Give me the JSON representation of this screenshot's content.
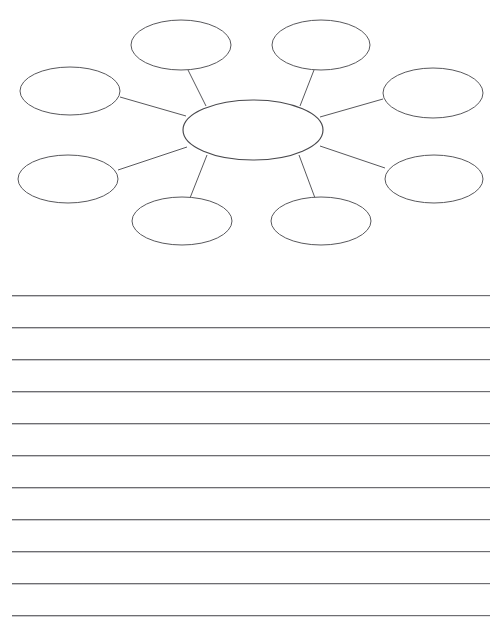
{
  "page": {
    "title": "Blank Web / Cluster Graphic Organizer Worksheet",
    "background_color": "#ffffff",
    "width": 503,
    "height": 634
  },
  "diagram": {
    "type": "cluster-web",
    "stroke_color": "#58585c",
    "fill_color": "#ffffff",
    "center": {
      "label": "",
      "cx": 253,
      "cy": 130,
      "rx": 70,
      "ry": 30
    },
    "nodes": [
      {
        "id": "node-top-left",
        "label": "",
        "cx": 181,
        "cy": 45,
        "rx": 50,
        "ry": 25
      },
      {
        "id": "node-top-right",
        "label": "",
        "cx": 321,
        "cy": 45,
        "rx": 49,
        "ry": 25
      },
      {
        "id": "node-left-upper",
        "label": "",
        "cx": 70,
        "cy": 91,
        "rx": 50,
        "ry": 24
      },
      {
        "id": "node-right-upper",
        "label": "",
        "cx": 433,
        "cy": 93,
        "rx": 50,
        "ry": 25
      },
      {
        "id": "node-left-lower",
        "label": "",
        "cx": 68,
        "cy": 179,
        "rx": 50,
        "ry": 24
      },
      {
        "id": "node-right-lower",
        "label": "",
        "cx": 434,
        "cy": 179,
        "rx": 49,
        "ry": 24
      },
      {
        "id": "node-bottom-left",
        "label": "",
        "cx": 182,
        "cy": 221,
        "rx": 50,
        "ry": 24
      },
      {
        "id": "node-bottom-right",
        "label": "",
        "cx": 321,
        "cy": 221,
        "rx": 50,
        "ry": 24
      }
    ],
    "connectors": [
      {
        "id": "connector-top-left",
        "from": "center",
        "to": "node-top-left",
        "x1": 206,
        "y1": 106,
        "x2": 188,
        "y2": 70
      },
      {
        "id": "connector-top-right",
        "from": "center",
        "to": "node-top-right",
        "x1": 300,
        "y1": 106,
        "x2": 314,
        "y2": 70
      },
      {
        "id": "connector-left-upper",
        "from": "center",
        "to": "node-left-upper",
        "x1": 186,
        "y1": 116,
        "x2": 120,
        "y2": 97
      },
      {
        "id": "connector-right-upper",
        "from": "center",
        "to": "node-right-upper",
        "x1": 320,
        "y1": 117,
        "x2": 383,
        "y2": 99
      },
      {
        "id": "connector-left-lower",
        "from": "center",
        "to": "node-left-lower",
        "x1": 187,
        "y1": 147,
        "x2": 118,
        "y2": 170
      },
      {
        "id": "connector-right-lower",
        "from": "center",
        "to": "node-right-lower",
        "x1": 320,
        "y1": 146,
        "x2": 385,
        "y2": 168
      },
      {
        "id": "connector-bottom-left",
        "from": "center",
        "to": "node-bottom-left",
        "x1": 207,
        "y1": 155,
        "x2": 190,
        "y2": 198
      },
      {
        "id": "connector-bottom-right",
        "from": "center",
        "to": "node-bottom-right",
        "x1": 299,
        "y1": 155,
        "x2": 315,
        "y2": 198
      }
    ]
  },
  "writing_lines": {
    "count": 11,
    "left": 12,
    "width": 478,
    "first_y": 20,
    "spacing": 32,
    "color": "#6e6e72",
    "values": [
      "",
      "",
      "",
      "",
      "",
      "",
      "",
      "",
      "",
      "",
      ""
    ]
  }
}
